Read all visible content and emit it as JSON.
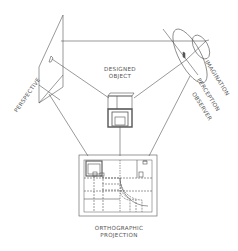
{
  "diagram": {
    "nodes": {
      "perspective": {
        "label": "PERSPECTIVE"
      },
      "designed_object": {
        "line1": "DESIGNED",
        "line2": "OBJECT"
      },
      "observer": {
        "labels": [
          "IMAGINATION",
          "PERCEPTION",
          "OBSERVER"
        ]
      },
      "orthographic": {
        "line1": "ORTHOGRAPHIC",
        "line2": "PROJECTION"
      }
    },
    "colors": {
      "line": "#555555",
      "text": "#555555",
      "background": "#ffffff"
    }
  }
}
